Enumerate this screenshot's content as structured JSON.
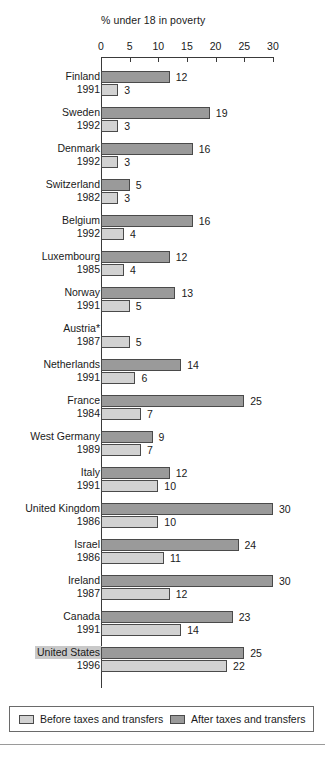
{
  "chart_data": {
    "type": "bar",
    "orientation": "horizontal",
    "title": "% under 18 in poverty",
    "xlabel": "",
    "ylabel": "",
    "xlim": [
      0,
      30
    ],
    "xticks": [
      0,
      5,
      10,
      15,
      20,
      25,
      30
    ],
    "grid": false,
    "legend_position": "bottom",
    "series": [
      {
        "name": "Before taxes and transfers",
        "color": "#d2d2d2",
        "values": [
          3,
          3,
          3,
          3,
          4,
          4,
          5,
          5,
          6,
          7,
          7,
          10,
          10,
          11,
          12,
          14,
          22
        ]
      },
      {
        "name": "After taxes and transfers",
        "color": "#9a9a9a",
        "values": [
          12,
          19,
          16,
          5,
          16,
          12,
          13,
          null,
          14,
          25,
          9,
          12,
          30,
          24,
          30,
          23,
          25
        ]
      }
    ],
    "categories": [
      "Finland",
      "Sweden",
      "Denmark",
      "Switzerland",
      "Belgium",
      "Luxembourg",
      "Norway",
      "Austria*",
      "Netherlands",
      "France",
      "West Germany",
      "Italy",
      "United Kingdom",
      "Israel",
      "Ireland",
      "Canada",
      "United States"
    ],
    "years": [
      "1991",
      "1992",
      "1992",
      "1982",
      "1992",
      "1985",
      "1991",
      "1987",
      "1991",
      "1984",
      "1989",
      "1991",
      "1986",
      "1986",
      "1987",
      "1991",
      "1996"
    ],
    "rows": [
      {
        "country": "Finland",
        "year": "1991",
        "after": 12,
        "before": 3,
        "highlight": false
      },
      {
        "country": "Sweden",
        "year": "1992",
        "after": 19,
        "before": 3,
        "highlight": false
      },
      {
        "country": "Denmark",
        "year": "1992",
        "after": 16,
        "before": 3,
        "highlight": false
      },
      {
        "country": "Switzerland",
        "year": "1982",
        "after": 5,
        "before": 3,
        "highlight": false
      },
      {
        "country": "Belgium",
        "year": "1992",
        "after": 16,
        "before": 4,
        "highlight": false
      },
      {
        "country": "Luxembourg",
        "year": "1985",
        "after": 12,
        "before": 4,
        "highlight": false
      },
      {
        "country": "Norway",
        "year": "1991",
        "after": 13,
        "before": 5,
        "highlight": false
      },
      {
        "country": "Austria*",
        "year": "1987",
        "after": null,
        "before": 5,
        "highlight": false
      },
      {
        "country": "Netherlands",
        "year": "1991",
        "after": 14,
        "before": 6,
        "highlight": false
      },
      {
        "country": "France",
        "year": "1984",
        "after": 25,
        "before": 7,
        "highlight": false
      },
      {
        "country": "West Germany",
        "year": "1989",
        "after": 9,
        "before": 7,
        "highlight": false
      },
      {
        "country": "Italy",
        "year": "1991",
        "after": 12,
        "before": 10,
        "highlight": false
      },
      {
        "country": "United Kingdom",
        "year": "1986",
        "after": 30,
        "before": 10,
        "highlight": false
      },
      {
        "country": "Israel",
        "year": "1986",
        "after": 24,
        "before": 11,
        "highlight": false
      },
      {
        "country": "Ireland",
        "year": "1987",
        "after": 30,
        "before": 12,
        "highlight": false
      },
      {
        "country": "Canada",
        "year": "1991",
        "after": 23,
        "before": 14,
        "highlight": false
      },
      {
        "country": "United States",
        "year": "1996",
        "after": 25,
        "before": 22,
        "highlight": true
      }
    ]
  },
  "legend": {
    "before_label": "Before taxes and transfers",
    "after_label": "After taxes and transfers"
  }
}
